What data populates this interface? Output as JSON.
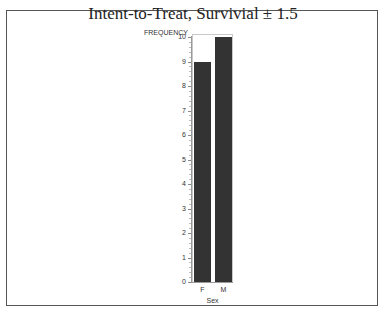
{
  "chart_data": {
    "type": "bar",
    "title": "Intent-to-Treat, Survivial ± 1.5",
    "xlabel": "Sex",
    "ylabel": "FREQUENCY",
    "categories": [
      "F",
      "M"
    ],
    "values": [
      9,
      10
    ],
    "ylim": [
      0,
      10
    ],
    "yticks": [
      0,
      1,
      2,
      3,
      4,
      5,
      6,
      7,
      8,
      9,
      10
    ],
    "grid": false,
    "legend": null,
    "bar_color": "#333333"
  }
}
